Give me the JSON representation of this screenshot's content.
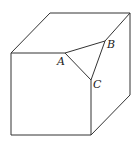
{
  "diagram": {
    "type": "cube-with-truncated-corner",
    "labels": {
      "A": "A",
      "B": "B",
      "C": "C"
    },
    "colors": {
      "stroke": "#333333",
      "background": "#ffffff",
      "label": "#222222"
    }
  }
}
